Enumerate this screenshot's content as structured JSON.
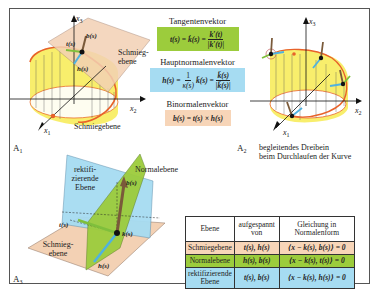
{
  "colors": {
    "frame": "#555555",
    "tangent_green": "#9ccc3c",
    "normal_blue": "#a6dcf2",
    "binormal_peach": "#f7d5b8",
    "cylinder_yellow": "#f7ec5c",
    "curve_orange": "#e8622a",
    "binormal_brown": "#7a5a3a",
    "osculating_plane": "#f3d1b4",
    "normal_plane_green": "#9ccc3c",
    "rectifying_plane_blue": "#a6dcf2"
  },
  "figure_a1": {
    "label": "A",
    "label_sub": "1",
    "axis_x1": "x",
    "axis_x1_sub": "1",
    "axis_x2": "x",
    "axis_x2_sub": "2",
    "axis_x3": "x",
    "axis_x3_sub": "3",
    "vec_t": "t(s)",
    "vec_b": "b(s)",
    "vec_h": "h(s)",
    "plane_label_line1": "Schmieg-",
    "plane_label_line2": "ebene",
    "caption_below": "Schmiegebene"
  },
  "formulas": {
    "tangent": {
      "title": "Tangentenvektor",
      "lhs": "t(s) = k̇(s) =",
      "num": "k′(t)",
      "den": "|k′(t)|",
      "bg": "#9ccc3c"
    },
    "principal_normal": {
      "title": "Hauptnormalenvektor",
      "lhs": "h(s) =",
      "frac1_num": "1",
      "frac1_den": "κ(s)",
      "mid": "k̈(s) =",
      "num": "k̈(s)",
      "den": "|k̈(s)|",
      "bg": "#a6dcf2"
    },
    "binormal": {
      "title": "Binormalenvektor",
      "expr": "b(s) = t(s) × h(s)",
      "bg": "#f7d5b8"
    }
  },
  "figure_a2": {
    "label": "A",
    "label_sub": "2",
    "axis_x1": "x",
    "axis_x1_sub": "1",
    "axis_x2": "x",
    "axis_x2_sub": "2",
    "axis_x3": "x",
    "axis_x3_sub": "3",
    "caption_line1": "begleitendes Dreibein",
    "caption_line2": "beim Durchlaufen der Kurve"
  },
  "figure_a3": {
    "label": "A",
    "label_sub": "3",
    "rect_plane_line1": "rektifi-",
    "rect_plane_line2": "zierende",
    "rect_plane_line3": "Ebene",
    "normal_plane": "Normalebene",
    "osc_plane_line1": "Schmieg-",
    "osc_plane_line2": "ebene",
    "vec_t": "t(s)",
    "vec_b": "b(s)",
    "vec_h": "h(s)",
    "point": "k(s)"
  },
  "table": {
    "headers": [
      "Ebene",
      "aufgespannt von",
      "Gleichung in Normalenform"
    ],
    "header_lines": [
      [
        "Ebene"
      ],
      [
        "aufgespannt",
        "von"
      ],
      [
        "Gleichung in",
        "Normalenform"
      ]
    ],
    "rows": [
      {
        "plane": "Schmiegebene",
        "spanned": "t(s), h(s)",
        "equation": "⟨x − k(s), b(s)⟩ = 0",
        "bg": "#f7d5b8"
      },
      {
        "plane": "Normalebene",
        "spanned": "h(s), b(s)",
        "equation": "⟨x − k(s), t(s)⟩ = 0",
        "bg": "#9ccc3c"
      },
      {
        "plane_line1": "rektifizierende",
        "plane_line2": "Ebene",
        "spanned": "t(s), b(s)",
        "equation": "⟨x − k(s), h(s)⟩ = 0",
        "bg": "#a6dcf2"
      }
    ]
  }
}
